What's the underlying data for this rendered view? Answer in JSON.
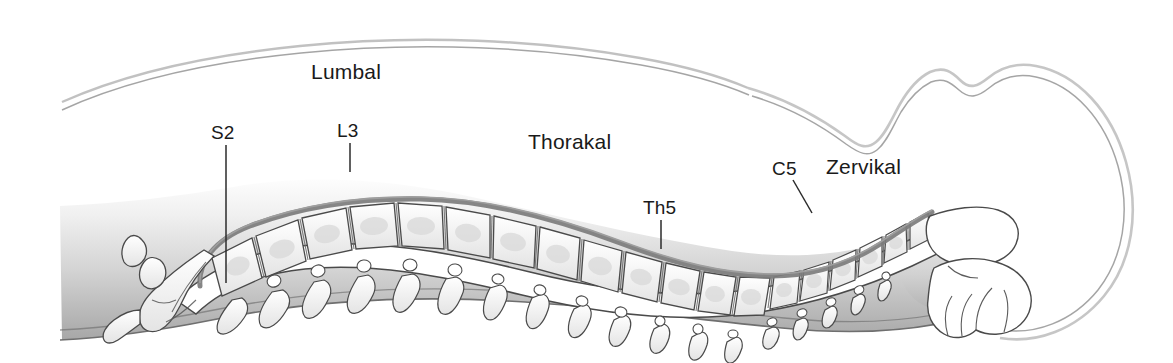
{
  "figure": {
    "language": "de",
    "background_color": "#ffffff"
  },
  "colors": {
    "text": "#1a1a1a",
    "leader_line": "#2b2b2b",
    "body_fill_top": "#fdfdfd",
    "body_fill_bottom": "#a9a9a9",
    "bone_fill": "#fbfbfb",
    "bone_shade": "#d8d8d8",
    "bone_outline": "#4a4a4a",
    "ligament": "#7a7a7a",
    "canal_fill": "#ffffff",
    "skin_outline": "#9a9a9a"
  },
  "region_labels": [
    {
      "id": "lumbal",
      "text": "Lumbal",
      "x": 311,
      "y": 60
    },
    {
      "id": "thorakal",
      "text": "Thorakal",
      "x": 528,
      "y": 130
    },
    {
      "id": "zervikal",
      "text": "Zervikal",
      "x": 826,
      "y": 155
    }
  ],
  "vertebra_labels": [
    {
      "id": "s2",
      "text": "S2",
      "x": 211,
      "y": 122,
      "leader": {
        "x1": 226,
        "y1": 145,
        "x2": 226,
        "y2": 283
      }
    },
    {
      "id": "l3",
      "text": "L3",
      "x": 337,
      "y": 120,
      "leader": {
        "x1": 350,
        "y1": 143,
        "x2": 350,
        "y2": 172
      }
    },
    {
      "id": "th5",
      "text": "Th5",
      "x": 643,
      "y": 197,
      "leader": {
        "x1": 661,
        "y1": 220,
        "x2": 661,
        "y2": 249
      }
    },
    {
      "id": "c5",
      "text": "C5",
      "x": 772,
      "y": 158,
      "leader": {
        "x1": 793,
        "y1": 180,
        "x2": 812,
        "y2": 213
      }
    }
  ],
  "structures": [
    {
      "id": "back-contour",
      "name": "posterior body contour"
    },
    {
      "id": "head-contour",
      "name": "head and neck contour"
    },
    {
      "id": "body-fill",
      "name": "trunk soft tissue silhouette"
    },
    {
      "id": "sacrum-coccyx",
      "name": "sacrum and coccyx"
    },
    {
      "id": "lumbar-spine",
      "name": "lumbar vertebrae"
    },
    {
      "id": "thoracic-spine",
      "name": "thoracic vertebrae"
    },
    {
      "id": "cervical-spine",
      "name": "cervical vertebrae"
    },
    {
      "id": "spinal-canal",
      "name": "spinal canal / spinal cord"
    },
    {
      "id": "cerebellum",
      "name": "cerebellum"
    },
    {
      "id": "brainstem",
      "name": "brainstem"
    },
    {
      "id": "skull",
      "name": "skull outline"
    }
  ]
}
